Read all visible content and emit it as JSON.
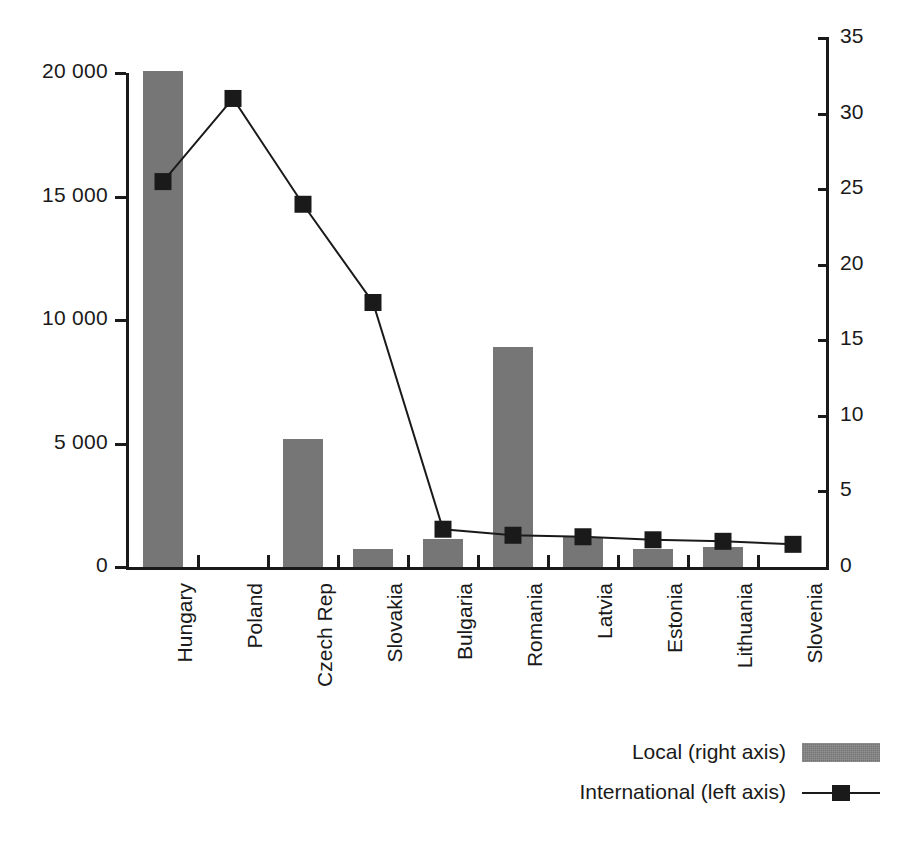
{
  "chart_data": {
    "type": "bar",
    "title": "",
    "subtitle": "",
    "xlabel": "",
    "ylabel": "",
    "grid": false,
    "legend_position": "bottom-right",
    "categories": [
      "Hungary",
      "Poland",
      "Czech Rep",
      "Slovakia",
      "Bulgaria",
      "Romania",
      "Latvia",
      "Estonia",
      "Lithuania",
      "Slovenia"
    ],
    "left_axis": {
      "name": "left",
      "ylim": [
        0,
        20000
      ],
      "ticks": [
        0,
        5000,
        10000,
        15000,
        20000
      ],
      "tick_labels": [
        "0",
        "5 000",
        "10 000",
        "15 000",
        "20 000"
      ]
    },
    "right_axis": {
      "name": "right",
      "ylim": [
        0,
        35
      ],
      "ticks": [
        0,
        5,
        10,
        15,
        20,
        25,
        30,
        35
      ],
      "tick_labels": [
        "0",
        "5",
        "10",
        "15",
        "20",
        "25",
        "30",
        "35"
      ]
    },
    "series": [
      {
        "name": "Local (right axis)",
        "type": "bar",
        "axis": "left",
        "color": "#767676",
        "values": [
          20100,
          0,
          5200,
          730,
          1150,
          8900,
          1220,
          730,
          830,
          0
        ]
      },
      {
        "name": "International (left axis)",
        "type": "line",
        "axis": "right",
        "color": "#1a1a1a",
        "marker": "square",
        "values": [
          25.5,
          31.0,
          24.0,
          17.5,
          2.5,
          2.1,
          2.0,
          1.8,
          1.7,
          1.5
        ]
      }
    ]
  },
  "legend": {
    "entries": [
      {
        "label": "Local (right axis)",
        "swatch": "bar-swatch"
      },
      {
        "label": "International (left axis)",
        "swatch": "line-marker-swatch"
      }
    ]
  },
  "colors": {
    "bar_fill": "#767676",
    "line_stroke": "#1a1a1a",
    "axis": "#1a1a1a",
    "background": "#ffffff"
  }
}
